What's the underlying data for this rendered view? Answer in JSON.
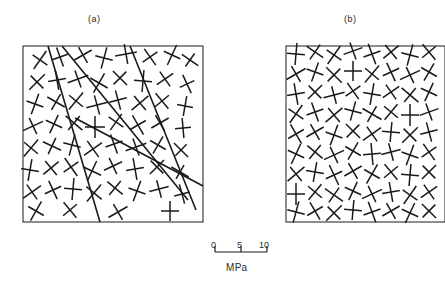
{
  "figure": {
    "type": "scientific-figure",
    "background_color": "#ffffff",
    "line_color": "#1a1a1a"
  },
  "panels": [
    {
      "id": "a",
      "label": "(a)",
      "label_x": 88,
      "label_y": 14,
      "box": {
        "x": 23,
        "y": 46,
        "width": 180,
        "height": 176
      },
      "has_faults": true,
      "fault_count": 4,
      "cross_count": 60
    },
    {
      "id": "b",
      "label": "(b)",
      "label_x": 344,
      "label_y": 14,
      "box": {
        "x": 286,
        "y": 46,
        "width": 159,
        "height": 176
      },
      "has_faults": false,
      "fault_count": 0,
      "cross_count": 72
    }
  ],
  "scale_bar": {
    "unit": "MPa",
    "ticks": [
      "0",
      "5",
      "10"
    ],
    "tick_values": [
      0,
      5,
      10
    ],
    "x_start": 215,
    "x_end": 267,
    "y": 252,
    "tick_height": 6
  },
  "chart_data": {
    "type": "scatter",
    "title": "",
    "xlabel": "",
    "ylabel": "",
    "legend": [],
    "grid": false,
    "scale_unit": "MPa",
    "scale_ticks": [
      0,
      5,
      10
    ],
    "panel_a_faults": [
      {
        "x1": 48,
        "y1": 46,
        "x2": 100,
        "y2": 222
      },
      {
        "x1": 62,
        "y1": 46,
        "x2": 188,
        "y2": 200
      },
      {
        "x1": 130,
        "y1": 46,
        "x2": 196,
        "y2": 210
      },
      {
        "x1": 75,
        "y1": 118,
        "x2": 203,
        "y2": 186
      }
    ],
    "panel_a_crosses": [
      [
        40,
        60,
        9,
        11,
        35
      ],
      [
        60,
        57,
        9,
        10,
        -20
      ],
      [
        83,
        55,
        9,
        10,
        60
      ],
      [
        104,
        58,
        9,
        11,
        15
      ],
      [
        126,
        54,
        10,
        11,
        80
      ],
      [
        150,
        57,
        9,
        10,
        -35
      ],
      [
        172,
        55,
        9,
        11,
        25
      ],
      [
        190,
        60,
        8,
        10,
        -55
      ],
      [
        37,
        82,
        9,
        11,
        45
      ],
      [
        57,
        80,
        9,
        10,
        -10
      ],
      [
        78,
        79,
        9,
        11,
        70
      ],
      [
        99,
        83,
        10,
        11,
        30
      ],
      [
        120,
        78,
        9,
        10,
        -45
      ],
      [
        143,
        81,
        9,
        11,
        5
      ],
      [
        165,
        79,
        9,
        10,
        55
      ],
      [
        187,
        84,
        8,
        10,
        -25
      ],
      [
        35,
        104,
        9,
        11,
        20
      ],
      [
        56,
        102,
        9,
        10,
        -60
      ],
      [
        76,
        101,
        9,
        11,
        40
      ],
      [
        97,
        105,
        10,
        11,
        75
      ],
      [
        118,
        100,
        9,
        10,
        -15
      ],
      [
        140,
        103,
        9,
        11,
        50
      ],
      [
        162,
        101,
        9,
        10,
        -40
      ],
      [
        185,
        106,
        8,
        10,
        10
      ],
      [
        33,
        126,
        9,
        11,
        65
      ],
      [
        54,
        124,
        9,
        10,
        25
      ],
      [
        74,
        123,
        9,
        11,
        -50
      ],
      [
        95,
        127,
        10,
        11,
        0
      ],
      [
        116,
        122,
        9,
        10,
        35
      ],
      [
        138,
        125,
        9,
        11,
        -30
      ],
      [
        160,
        123,
        9,
        10,
        60
      ],
      [
        183,
        128,
        8,
        10,
        -5
      ],
      [
        31,
        148,
        9,
        11,
        40
      ],
      [
        52,
        146,
        9,
        10,
        -65
      ],
      [
        72,
        145,
        9,
        11,
        15
      ],
      [
        93,
        149,
        10,
        11,
        55
      ],
      [
        114,
        144,
        9,
        10,
        -20
      ],
      [
        136,
        147,
        9,
        11,
        70
      ],
      [
        158,
        145,
        9,
        10,
        30
      ],
      [
        181,
        150,
        8,
        10,
        -45
      ],
      [
        30,
        170,
        9,
        11,
        10
      ],
      [
        51,
        168,
        9,
        10,
        50
      ],
      [
        71,
        167,
        9,
        11,
        -35
      ],
      [
        92,
        171,
        10,
        11,
        25
      ],
      [
        113,
        166,
        9,
        10,
        65
      ],
      [
        135,
        169,
        9,
        11,
        -10
      ],
      [
        157,
        167,
        9,
        10,
        45
      ],
      [
        180,
        172,
        8,
        10,
        -60
      ],
      [
        32,
        192,
        9,
        11,
        55
      ],
      [
        53,
        190,
        9,
        10,
        -25
      ],
      [
        73,
        189,
        9,
        11,
        5
      ],
      [
        94,
        193,
        10,
        11,
        40
      ],
      [
        115,
        188,
        9,
        10,
        -50
      ],
      [
        137,
        191,
        9,
        11,
        20
      ],
      [
        159,
        189,
        9,
        10,
        75
      ],
      [
        182,
        194,
        8,
        10,
        -15
      ],
      [
        36,
        211,
        9,
        11,
        30
      ],
      [
        70,
        210,
        9,
        10,
        -40
      ],
      [
        118,
        212,
        9,
        11,
        60
      ],
      [
        170,
        211,
        9,
        10,
        0
      ]
    ],
    "panel_b_crosses": [
      [
        296,
        54,
        9,
        11,
        5
      ],
      [
        315,
        52,
        9,
        10,
        -55
      ],
      [
        334,
        55,
        9,
        11,
        35
      ],
      [
        353,
        51,
        9,
        10,
        70
      ],
      [
        372,
        54,
        9,
        11,
        -20
      ],
      [
        391,
        52,
        9,
        10,
        50
      ],
      [
        410,
        55,
        9,
        11,
        15
      ],
      [
        429,
        52,
        9,
        10,
        -40
      ],
      [
        296,
        74,
        9,
        11,
        60
      ],
      [
        315,
        72,
        9,
        10,
        20
      ],
      [
        334,
        75,
        9,
        11,
        -45
      ],
      [
        353,
        71,
        9,
        10,
        0
      ],
      [
        372,
        74,
        9,
        11,
        40
      ],
      [
        391,
        72,
        9,
        10,
        -25
      ],
      [
        410,
        75,
        9,
        11,
        65
      ],
      [
        429,
        72,
        9,
        10,
        30
      ],
      [
        296,
        94,
        9,
        11,
        -10
      ],
      [
        315,
        92,
        9,
        10,
        45
      ],
      [
        334,
        95,
        9,
        11,
        75
      ],
      [
        353,
        91,
        9,
        10,
        -35
      ],
      [
        372,
        94,
        9,
        11,
        10
      ],
      [
        391,
        92,
        9,
        10,
        55
      ],
      [
        410,
        95,
        9,
        11,
        -50
      ],
      [
        429,
        92,
        9,
        10,
        25
      ],
      [
        296,
        114,
        9,
        11,
        35
      ],
      [
        315,
        112,
        9,
        10,
        -20
      ],
      [
        334,
        115,
        9,
        11,
        50
      ],
      [
        353,
        111,
        9,
        10,
        15
      ],
      [
        372,
        114,
        9,
        11,
        -60
      ],
      [
        391,
        112,
        9,
        10,
        40
      ],
      [
        410,
        115,
        9,
        11,
        0
      ],
      [
        429,
        112,
        9,
        10,
        70
      ],
      [
        296,
        134,
        9,
        11,
        -30
      ],
      [
        315,
        132,
        9,
        10,
        60
      ],
      [
        334,
        135,
        9,
        11,
        20
      ],
      [
        353,
        131,
        9,
        10,
        -45
      ],
      [
        372,
        134,
        9,
        11,
        55
      ],
      [
        391,
        132,
        9,
        10,
        5
      ],
      [
        410,
        135,
        9,
        11,
        45
      ],
      [
        429,
        132,
        9,
        10,
        -15
      ],
      [
        296,
        154,
        9,
        11,
        25
      ],
      [
        315,
        152,
        9,
        10,
        -50
      ],
      [
        334,
        155,
        9,
        11,
        65
      ],
      [
        353,
        151,
        9,
        10,
        30
      ],
      [
        372,
        154,
        9,
        11,
        -5
      ],
      [
        391,
        152,
        9,
        10,
        75
      ],
      [
        410,
        155,
        9,
        11,
        20
      ],
      [
        429,
        152,
        9,
        10,
        -35
      ],
      [
        296,
        174,
        9,
        11,
        50
      ],
      [
        315,
        172,
        9,
        10,
        10
      ],
      [
        334,
        175,
        9,
        11,
        -25
      ],
      [
        353,
        171,
        9,
        10,
        60
      ],
      [
        372,
        174,
        9,
        11,
        30
      ],
      [
        391,
        172,
        9,
        10,
        -40
      ],
      [
        410,
        175,
        9,
        11,
        5
      ],
      [
        429,
        172,
        9,
        10,
        45
      ],
      [
        296,
        194,
        9,
        11,
        0
      ],
      [
        315,
        192,
        9,
        10,
        40
      ],
      [
        334,
        195,
        9,
        11,
        -55
      ],
      [
        353,
        191,
        9,
        10,
        25
      ],
      [
        372,
        194,
        9,
        11,
        65
      ],
      [
        391,
        192,
        9,
        10,
        -10
      ],
      [
        410,
        195,
        9,
        11,
        35
      ],
      [
        429,
        192,
        9,
        10,
        55
      ],
      [
        296,
        212,
        9,
        11,
        15
      ],
      [
        315,
        211,
        9,
        10,
        -30
      ],
      [
        334,
        213,
        9,
        11,
        45
      ],
      [
        353,
        210,
        9,
        10,
        5
      ],
      [
        372,
        212,
        9,
        11,
        -20
      ],
      [
        391,
        211,
        9,
        10,
        60
      ],
      [
        410,
        213,
        9,
        11,
        25
      ],
      [
        429,
        211,
        9,
        10,
        -45
      ]
    ]
  }
}
